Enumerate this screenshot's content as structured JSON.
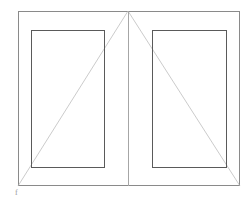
{
  "drawing": {
    "title": "Double window elevation",
    "type": "cad-elevation",
    "canvas": {
      "width": 248,
      "height": 203,
      "background": "#ffffff"
    },
    "colors": {
      "outer_frame_stroke": "#8a8a8a",
      "sash_stroke": "#5a5a5a",
      "mullion_stroke": "#a6a6a6",
      "opening_indicator_stroke": "#b4b4b4",
      "annotation": "#9a9a9a"
    },
    "stroke_widths": {
      "outer_frame": 1,
      "sash": 1,
      "mullion": 1,
      "opening_indicator": 0.7
    },
    "outer_frame": {
      "name": "outer-frame",
      "x": 18,
      "y": 11,
      "width": 222,
      "height": 175
    },
    "mullion": {
      "name": "center-mullion",
      "x": 128,
      "y1": 11,
      "y2": 186
    },
    "sashes": [
      {
        "name": "left-sash",
        "x": 31,
        "y": 30,
        "width": 74,
        "height": 138
      },
      {
        "name": "right-sash",
        "x": 152,
        "y": 30,
        "width": 75,
        "height": 138
      }
    ],
    "opening_indicators": [
      {
        "name": "left-opening-indicator",
        "from_x": 128,
        "from_y": 11,
        "to_x": 18,
        "to_y": 186
      },
      {
        "name": "right-opening-indicator",
        "from_x": 128,
        "from_y": 11,
        "to_x": 240,
        "to_y": 186
      }
    ],
    "annotation_label": "f"
  }
}
